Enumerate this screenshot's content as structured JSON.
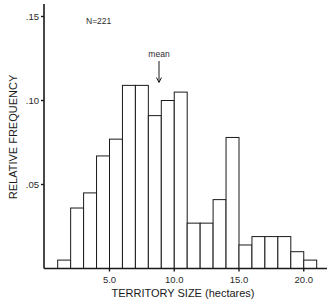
{
  "chart_data": {
    "type": "bar",
    "subtype": "histogram",
    "title": "",
    "xlabel": "TERRITORY SIZE (hectares)",
    "ylabel": "RELATIVE FREQUENCY",
    "bin_width": 1.0,
    "bins": [
      {
        "start": 1,
        "end": 2,
        "value": 0.005
      },
      {
        "start": 2,
        "end": 3,
        "value": 0.036
      },
      {
        "start": 3,
        "end": 4,
        "value": 0.045
      },
      {
        "start": 4,
        "end": 5,
        "value": 0.067
      },
      {
        "start": 5,
        "end": 6,
        "value": 0.077
      },
      {
        "start": 6,
        "end": 7,
        "value": 0.109
      },
      {
        "start": 7,
        "end": 8,
        "value": 0.109
      },
      {
        "start": 8,
        "end": 9,
        "value": 0.091
      },
      {
        "start": 9,
        "end": 10,
        "value": 0.1
      },
      {
        "start": 10,
        "end": 11,
        "value": 0.105
      },
      {
        "start": 11,
        "end": 12,
        "value": 0.027
      },
      {
        "start": 12,
        "end": 13,
        "value": 0.027
      },
      {
        "start": 13,
        "end": 14,
        "value": 0.041
      },
      {
        "start": 14,
        "end": 15,
        "value": 0.078
      },
      {
        "start": 15,
        "end": 16,
        "value": 0.014
      },
      {
        "start": 16,
        "end": 17,
        "value": 0.019
      },
      {
        "start": 17,
        "end": 18,
        "value": 0.019
      },
      {
        "start": 18,
        "end": 19,
        "value": 0.019
      },
      {
        "start": 19,
        "end": 20,
        "value": 0.01
      },
      {
        "start": 20,
        "end": 21,
        "value": 0.005
      }
    ],
    "x_ticks": [
      {
        "value": 5.0,
        "label": "5.0"
      },
      {
        "value": 10.0,
        "label": "10.0"
      },
      {
        "value": 15.0,
        "label": "15.0"
      },
      {
        "value": 20.0,
        "label": "20.0"
      }
    ],
    "y_ticks": [
      {
        "value": 0.05,
        "label": ".05"
      },
      {
        "value": 0.1,
        "label": ".10"
      },
      {
        "value": 0.15,
        "label": ".15"
      }
    ],
    "xlim": [
      0,
      22
    ],
    "ylim": [
      0,
      0.155
    ],
    "grid": false,
    "legend": null,
    "annotations": [
      {
        "text": "N=221",
        "position": "top-left"
      },
      {
        "text": "mean",
        "type": "arrow",
        "x": 8.8
      }
    ]
  },
  "labels": {
    "sample_size": "N=221",
    "mean_label": "mean",
    "x_axis_title": "TERRITORY SIZE (hectares)",
    "y_axis_title": "RELATIVE FREQUENCY"
  },
  "style": {
    "line_color": "#1a1a1a",
    "bar_fill": "#ffffff",
    "background": "#ffffff"
  }
}
